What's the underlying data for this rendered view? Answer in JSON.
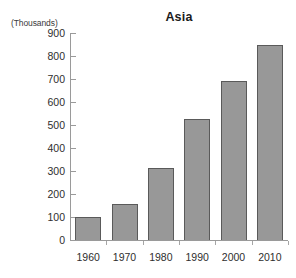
{
  "chart_data": {
    "type": "bar",
    "title": "Asia",
    "unit_label": "(Thousands)",
    "xlabel": "",
    "ylabel": "",
    "categories": [
      "1960",
      "1970",
      "1980",
      "1990",
      "2000",
      "2010"
    ],
    "values": [
      100,
      155,
      313,
      525,
      690,
      847
    ],
    "ylim": [
      0,
      900
    ],
    "ytick_step": 100,
    "yticks": [
      0,
      100,
      200,
      300,
      400,
      500,
      600,
      700,
      800,
      900
    ],
    "ytick_labels": [
      "0",
      "100",
      "200",
      "300",
      "400",
      "500",
      "600",
      "700",
      "800",
      "900"
    ],
    "grid": false,
    "legend": false,
    "legend_position": "none",
    "series": [
      {
        "name": "Asia",
        "values": [
          100,
          155,
          313,
          525,
          690,
          847
        ]
      }
    ],
    "colors": {
      "bar_fill": "#989898",
      "bar_border": "#5a5a5a",
      "axis": "#9a9a9a",
      "text": "#2e2e2e",
      "background": "#ffffff"
    }
  }
}
